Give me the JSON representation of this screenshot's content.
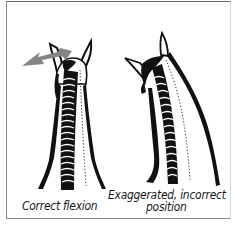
{
  "figure": {
    "panels": [
      {
        "id": "correct",
        "caption": "Correct flexion",
        "illustration": "horse-neck-rear-view-correct",
        "arrow": {
          "present": true,
          "direction": "left",
          "color": "#858585"
        }
      },
      {
        "id": "incorrect",
        "caption_line1": "Exaggerated, incorrect",
        "caption_line2": "position",
        "illustration": "horse-neck-rear-view-exaggerated",
        "arrow": {
          "present": false
        }
      }
    ],
    "colors": {
      "ink": "#111111",
      "arrow": "#858585",
      "frame": "#7a7a7a",
      "background": "#ffffff"
    }
  }
}
